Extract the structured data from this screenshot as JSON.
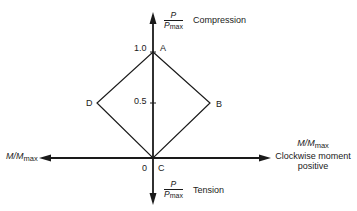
{
  "diagram": {
    "type": "interaction-diagram",
    "vertical_axis": {
      "fraction_numerator": "P",
      "fraction_denominator_main": "P",
      "fraction_denominator_sub": "max",
      "top_label": "Compression",
      "bottom_label": "Tension",
      "ticks": [
        {
          "value": "1.0"
        },
        {
          "value": "0.5"
        },
        {
          "value": "0"
        }
      ]
    },
    "horizontal_axis": {
      "left_label_main": "M/M",
      "left_label_sub": "max",
      "right_label_main": "M/M",
      "right_label_sub": "max",
      "right_caption_line1": "Clockwise moment",
      "right_caption_line2": "positive"
    },
    "points": [
      {
        "label": "A",
        "m": 0,
        "p": 1.0
      },
      {
        "label": "B",
        "m": 0.5,
        "p": 0.5
      },
      {
        "label": "C",
        "m": 0,
        "p": 0
      },
      {
        "label": "D",
        "m": -0.5,
        "p": 0.5
      }
    ],
    "line_color": "#1a1a1a"
  }
}
